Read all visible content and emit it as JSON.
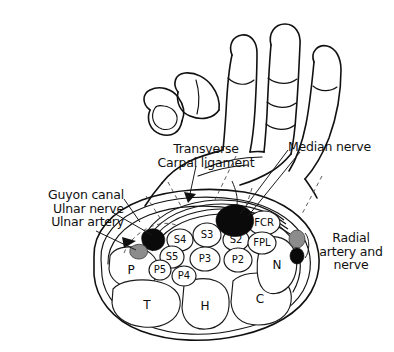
{
  "figure": {
    "background_color": "#ffffff",
    "ink_color": "#111111",
    "artery_color": "#8c8c8c",
    "nerve_color": "#0a0a0a"
  },
  "callouts": {
    "guyon": {
      "line1": "Guyon canal",
      "line2": "Ulnar nerve",
      "line3": "Ulnar artery"
    },
    "transverse": {
      "line1": "Transverse",
      "line2": "Carpal ligament"
    },
    "median": {
      "line1": "Median nerve"
    },
    "radial": {
      "line1": "Radial",
      "line2": "artery and",
      "line3": "nerve"
    }
  },
  "structures": {
    "bones": [
      {
        "id": "pisiform",
        "label": "P"
      },
      {
        "id": "trapezium",
        "label": "T"
      },
      {
        "id": "hamate",
        "label": "H"
      },
      {
        "id": "capitate",
        "label": "C"
      },
      {
        "id": "navicular",
        "label": "N"
      }
    ],
    "tendons_superficialis": [
      {
        "id": "s2",
        "label": "S2"
      },
      {
        "id": "s3",
        "label": "S3"
      },
      {
        "id": "s4",
        "label": "S4"
      },
      {
        "id": "s5",
        "label": "S5"
      }
    ],
    "tendons_profundus": [
      {
        "id": "p2",
        "label": "P2"
      },
      {
        "id": "p3",
        "label": "P3"
      },
      {
        "id": "p4",
        "label": "P4"
      },
      {
        "id": "p5",
        "label": "P5"
      }
    ],
    "tendons_other": [
      {
        "id": "fcr",
        "label": "FCR"
      },
      {
        "id": "fpl",
        "label": "FPL"
      }
    ]
  }
}
